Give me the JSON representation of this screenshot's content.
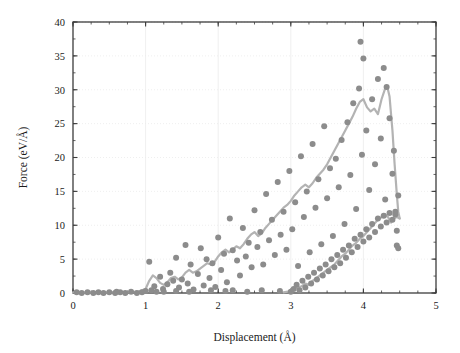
{
  "chart_data": {
    "type": "scatter",
    "title": "",
    "subtitle": "",
    "xlabel": "Displacement (Å)",
    "ylabel": "Force (eV/Å)",
    "xlim": [
      0,
      5
    ],
    "ylim": [
      0,
      40
    ],
    "xticks": [
      0,
      1,
      2,
      3,
      4,
      5
    ],
    "yticks": [
      0,
      5,
      10,
      15,
      20,
      25,
      30,
      35,
      40
    ],
    "xtick_labels": [
      "0",
      "1",
      "2",
      "3",
      "4",
      "5"
    ],
    "ytick_labels": [
      "0",
      "5",
      "10",
      "15",
      "20",
      "25",
      "30",
      "35",
      "40"
    ],
    "x_minor_interval": 0.25,
    "y_minor_interval": 2.5,
    "grid": true,
    "grid_style": "dotted-major",
    "legend": null,
    "legend_position": "none",
    "marker_color": "#8c8c8c",
    "marker_size": 4.2,
    "marker_shape": "circle",
    "line_color": "#b3b3b3",
    "line_width": 2.2,
    "axis_color": "#3c3c3c",
    "grid_color": "#ebebeb",
    "series": [
      {
        "name": "Force data points",
        "type": "scatter",
        "points": [
          [
            0.05,
            0.1
          ],
          [
            0.12,
            0.0
          ],
          [
            0.2,
            0.1
          ],
          [
            0.28,
            0.0
          ],
          [
            0.35,
            0.1
          ],
          [
            0.42,
            0.0
          ],
          [
            0.5,
            0.1
          ],
          [
            0.58,
            0.0
          ],
          [
            0.65,
            0.1
          ],
          [
            0.72,
            0.0
          ],
          [
            0.8,
            0.2
          ],
          [
            0.88,
            0.0
          ],
          [
            0.95,
            0.1
          ],
          [
            1.0,
            0.3
          ],
          [
            1.05,
            4.6
          ],
          [
            1.08,
            0.4
          ],
          [
            1.12,
            1.0
          ],
          [
            1.15,
            0.2
          ],
          [
            1.2,
            2.4
          ],
          [
            1.24,
            0.6
          ],
          [
            1.3,
            1.3
          ],
          [
            1.34,
            3.0
          ],
          [
            1.38,
            1.8
          ],
          [
            1.42,
            5.2
          ],
          [
            1.46,
            0.8
          ],
          [
            1.5,
            2.0
          ],
          [
            1.55,
            7.1
          ],
          [
            1.58,
            1.4
          ],
          [
            1.62,
            4.2
          ],
          [
            1.66,
            0.5
          ],
          [
            1.72,
            2.8
          ],
          [
            1.76,
            6.6
          ],
          [
            1.8,
            1.1
          ],
          [
            1.84,
            5.0
          ],
          [
            1.88,
            2.2
          ],
          [
            1.92,
            4.4
          ],
          [
            1.96,
            0.9
          ],
          [
            2.0,
            8.2
          ],
          [
            2.04,
            3.4
          ],
          [
            2.08,
            5.8
          ],
          [
            2.12,
            1.6
          ],
          [
            2.16,
            11.0
          ],
          [
            2.2,
            6.3
          ],
          [
            2.26,
            4.8
          ],
          [
            2.3,
            2.6
          ],
          [
            2.34,
            9.6
          ],
          [
            2.38,
            5.4
          ],
          [
            2.42,
            7.4
          ],
          [
            2.46,
            3.8
          ],
          [
            2.5,
            12.2
          ],
          [
            2.54,
            6.8
          ],
          [
            2.58,
            9.0
          ],
          [
            2.62,
            4.2
          ],
          [
            2.66,
            14.6
          ],
          [
            2.7,
            7.8
          ],
          [
            2.74,
            10.8
          ],
          [
            2.78,
            5.6
          ],
          [
            2.82,
            16.4
          ],
          [
            2.86,
            8.6
          ],
          [
            2.9,
            12.0
          ],
          [
            2.94,
            6.4
          ],
          [
            2.98,
            18.0
          ],
          [
            3.02,
            9.4
          ],
          [
            3.06,
            13.4
          ],
          [
            3.1,
            4.0
          ],
          [
            3.14,
            20.2
          ],
          [
            3.18,
            11.2
          ],
          [
            3.22,
            15.0
          ],
          [
            3.26,
            6.0
          ],
          [
            3.3,
            22.0
          ],
          [
            3.34,
            12.6
          ],
          [
            3.38,
            16.8
          ],
          [
            3.42,
            7.2
          ],
          [
            3.46,
            24.6
          ],
          [
            3.5,
            14.0
          ],
          [
            3.54,
            18.4
          ],
          [
            3.58,
            8.4
          ],
          [
            3.62,
            19.8
          ],
          [
            3.66,
            15.6
          ],
          [
            3.7,
            22.6
          ],
          [
            3.74,
            10.2
          ],
          [
            3.78,
            25.2
          ],
          [
            3.82,
            17.4
          ],
          [
            3.86,
            28.0
          ],
          [
            3.9,
            12.4
          ],
          [
            3.94,
            30.2
          ],
          [
            3.96,
            37.1
          ],
          [
            3.98,
            20.4
          ],
          [
            4.0,
            34.6
          ],
          [
            4.04,
            24.0
          ],
          [
            4.08,
            15.2
          ],
          [
            4.12,
            28.6
          ],
          [
            4.16,
            19.0
          ],
          [
            4.2,
            31.6
          ],
          [
            4.24,
            22.8
          ],
          [
            4.28,
            33.2
          ],
          [
            4.3,
            13.8
          ],
          [
            4.32,
            30.4
          ],
          [
            4.36,
            25.8
          ],
          [
            4.4,
            17.6
          ],
          [
            4.42,
            21.0
          ],
          [
            4.44,
            11.6
          ],
          [
            4.46,
            7.0
          ],
          [
            4.48,
            14.4
          ],
          [
            3.0,
            0.2
          ],
          [
            3.04,
            0.6
          ],
          [
            3.08,
            1.2
          ],
          [
            3.12,
            0.4
          ],
          [
            3.16,
            1.8
          ],
          [
            3.2,
            0.8
          ],
          [
            3.24,
            2.4
          ],
          [
            3.28,
            1.4
          ],
          [
            3.32,
            3.0
          ],
          [
            3.36,
            2.0
          ],
          [
            3.4,
            3.6
          ],
          [
            3.44,
            2.6
          ],
          [
            3.48,
            4.2
          ],
          [
            3.52,
            3.2
          ],
          [
            3.56,
            5.0
          ],
          [
            3.6,
            3.8
          ],
          [
            3.64,
            5.6
          ],
          [
            3.68,
            4.4
          ],
          [
            3.72,
            6.4
          ],
          [
            3.76,
            5.2
          ],
          [
            3.8,
            7.0
          ],
          [
            3.84,
            6.0
          ],
          [
            3.88,
            8.0
          ],
          [
            3.92,
            6.8
          ],
          [
            3.96,
            8.6
          ],
          [
            4.0,
            7.6
          ],
          [
            4.04,
            9.4
          ],
          [
            4.08,
            8.2
          ],
          [
            4.12,
            10.2
          ],
          [
            4.16,
            9.0
          ],
          [
            4.2,
            11.0
          ],
          [
            4.24,
            9.8
          ],
          [
            4.28,
            11.4
          ],
          [
            4.32,
            10.4
          ],
          [
            4.36,
            11.8
          ],
          [
            4.4,
            10.8
          ],
          [
            4.44,
            12.0
          ],
          [
            4.46,
            9.2
          ],
          [
            4.48,
            6.6
          ],
          [
            1.42,
            0.3
          ],
          [
            1.6,
            0.2
          ],
          [
            1.9,
            0.4
          ],
          [
            2.1,
            0.3
          ],
          [
            2.4,
            0.2
          ],
          [
            2.6,
            0.4
          ],
          [
            2.85,
            0.3
          ],
          [
            1.25,
            0.2
          ],
          [
            2.2,
            0.4
          ],
          [
            0.6,
            0.2
          ]
        ]
      },
      {
        "name": "Running average (loading branch)",
        "type": "line",
        "points": [
          [
            0.0,
            0.1
          ],
          [
            0.3,
            0.1
          ],
          [
            0.6,
            0.1
          ],
          [
            0.9,
            0.2
          ],
          [
            1.0,
            0.6
          ],
          [
            1.05,
            1.8
          ],
          [
            1.1,
            2.6
          ],
          [
            1.15,
            2.2
          ],
          [
            1.2,
            1.5
          ],
          [
            1.25,
            1.2
          ],
          [
            1.3,
            1.6
          ],
          [
            1.35,
            2.2
          ],
          [
            1.4,
            2.4
          ],
          [
            1.45,
            2.0
          ],
          [
            1.5,
            2.3
          ],
          [
            1.55,
            3.0
          ],
          [
            1.6,
            3.4
          ],
          [
            1.65,
            3.0
          ],
          [
            1.7,
            3.2
          ],
          [
            1.75,
            3.6
          ],
          [
            1.8,
            4.0
          ],
          [
            1.85,
            4.4
          ],
          [
            1.9,
            4.2
          ],
          [
            1.95,
            4.6
          ],
          [
            2.0,
            5.4
          ],
          [
            2.05,
            6.0
          ],
          [
            2.1,
            6.4
          ],
          [
            2.15,
            6.0
          ],
          [
            2.2,
            6.4
          ],
          [
            2.25,
            6.9
          ],
          [
            2.3,
            6.6
          ],
          [
            2.35,
            7.2
          ],
          [
            2.4,
            8.0
          ],
          [
            2.45,
            8.6
          ],
          [
            2.5,
            9.0
          ],
          [
            2.55,
            8.4
          ],
          [
            2.6,
            8.8
          ],
          [
            2.65,
            9.6
          ],
          [
            2.7,
            10.2
          ],
          [
            2.75,
            10.8
          ],
          [
            2.8,
            11.4
          ],
          [
            2.85,
            12.0
          ],
          [
            2.9,
            12.6
          ],
          [
            2.95,
            13.0
          ],
          [
            3.0,
            13.6
          ],
          [
            3.05,
            14.4
          ],
          [
            3.1,
            15.0
          ],
          [
            3.15,
            15.6
          ],
          [
            3.2,
            16.0
          ],
          [
            3.25,
            15.6
          ],
          [
            3.3,
            16.2
          ],
          [
            3.35,
            17.0
          ],
          [
            3.4,
            17.6
          ],
          [
            3.45,
            18.2
          ],
          [
            3.5,
            19.0
          ],
          [
            3.55,
            20.0
          ],
          [
            3.6,
            21.0
          ],
          [
            3.65,
            22.0
          ],
          [
            3.7,
            23.0
          ],
          [
            3.75,
            24.0
          ],
          [
            3.8,
            25.0
          ],
          [
            3.85,
            26.0
          ],
          [
            3.9,
            27.2
          ],
          [
            3.95,
            28.2
          ],
          [
            4.0,
            28.6
          ],
          [
            4.05,
            27.4
          ],
          [
            4.1,
            26.8
          ],
          [
            4.15,
            27.2
          ],
          [
            4.2,
            26.4
          ],
          [
            4.25,
            28.6
          ],
          [
            4.3,
            30.2
          ],
          [
            4.33,
            30.4
          ],
          [
            4.36,
            29.0
          ],
          [
            4.4,
            24.0
          ],
          [
            4.43,
            19.0
          ],
          [
            4.46,
            14.6
          ],
          [
            4.48,
            12.0
          ],
          [
            4.5,
            11.0
          ]
        ]
      },
      {
        "name": "Running average (unloading branch)",
        "type": "line",
        "points": [
          [
            2.9,
            0.1
          ],
          [
            3.0,
            0.3
          ],
          [
            3.05,
            0.6
          ],
          [
            3.1,
            0.8
          ],
          [
            3.15,
            1.0
          ],
          [
            3.2,
            1.4
          ],
          [
            3.25,
            1.2
          ],
          [
            3.3,
            1.8
          ],
          [
            3.35,
            2.2
          ],
          [
            3.4,
            2.6
          ],
          [
            3.45,
            3.0
          ],
          [
            3.5,
            3.4
          ],
          [
            3.55,
            3.8
          ],
          [
            3.6,
            4.2
          ],
          [
            3.65,
            4.8
          ],
          [
            3.7,
            5.4
          ],
          [
            3.75,
            5.8
          ],
          [
            3.8,
            6.4
          ],
          [
            3.85,
            7.0
          ],
          [
            3.9,
            7.4
          ],
          [
            3.95,
            8.0
          ],
          [
            4.0,
            8.4
          ],
          [
            4.05,
            9.0
          ],
          [
            4.1,
            9.6
          ],
          [
            4.15,
            10.2
          ],
          [
            4.2,
            10.8
          ],
          [
            4.25,
            11.2
          ],
          [
            4.3,
            11.6
          ],
          [
            4.34,
            11.2
          ],
          [
            4.38,
            10.4
          ],
          [
            4.42,
            11.0
          ],
          [
            4.46,
            11.2
          ],
          [
            4.5,
            11.0
          ]
        ]
      }
    ],
    "annotations": []
  }
}
